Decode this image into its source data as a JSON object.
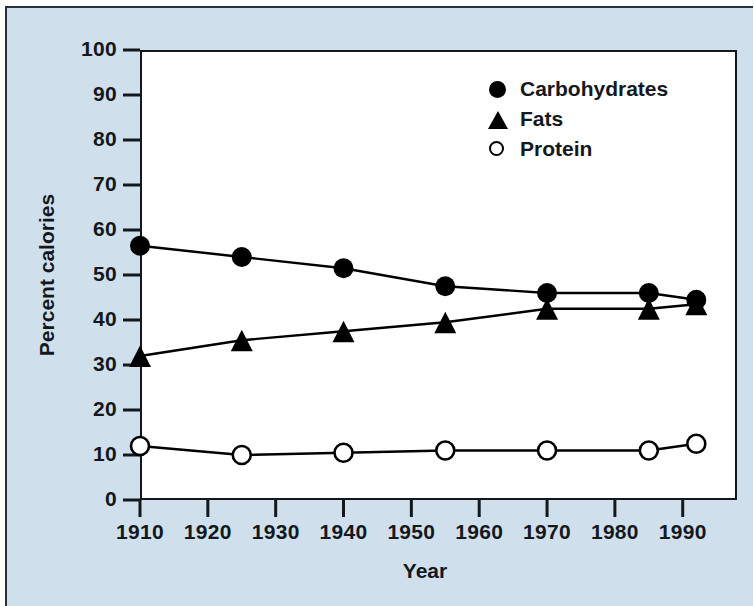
{
  "figure": {
    "panel_background": "#cfe0ec",
    "plot_background": "#ffffff",
    "axis_color": "#14181c"
  },
  "axes": {
    "ylabel": "Percent calories",
    "xlabel": "Year",
    "yticks": [
      "0",
      "10",
      "20",
      "30",
      "40",
      "50",
      "60",
      "70",
      "80",
      "90",
      "100"
    ],
    "xticks": [
      "1910",
      "1920",
      "1930",
      "1940",
      "1950",
      "1960",
      "1970",
      "1980",
      "1990"
    ]
  },
  "legend": {
    "items": [
      {
        "label": "Carbohydrates",
        "marker": "filled-circle-icon"
      },
      {
        "label": "Fats",
        "marker": "filled-triangle-icon"
      },
      {
        "label": "Protein",
        "marker": "open-circle-icon"
      }
    ]
  },
  "chart_data": {
    "type": "line",
    "title": "",
    "xlabel": "Year",
    "ylabel": "Percent calories",
    "xlim": [
      1910,
      1998
    ],
    "ylim": [
      0,
      100
    ],
    "xticks": [
      1910,
      1920,
      1930,
      1940,
      1950,
      1960,
      1970,
      1980,
      1990
    ],
    "yticks": [
      0,
      10,
      20,
      30,
      40,
      50,
      60,
      70,
      80,
      90,
      100
    ],
    "grid": false,
    "legend_position": "upper right",
    "x": [
      1910,
      1925,
      1940,
      1955,
      1970,
      1985,
      1992
    ],
    "series": [
      {
        "name": "Carbohydrates",
        "marker": "filled-circle",
        "color": "#000000",
        "values": [
          56.5,
          54.0,
          51.5,
          47.5,
          46.0,
          46.0,
          44.5
        ]
      },
      {
        "name": "Fats",
        "marker": "filled-triangle",
        "color": "#000000",
        "values": [
          32.0,
          35.5,
          37.5,
          39.5,
          42.5,
          42.5,
          43.5
        ]
      },
      {
        "name": "Protein",
        "marker": "open-circle",
        "color": "#000000",
        "values": [
          12.0,
          10.0,
          10.5,
          11.0,
          11.0,
          11.0,
          12.5
        ]
      }
    ]
  }
}
